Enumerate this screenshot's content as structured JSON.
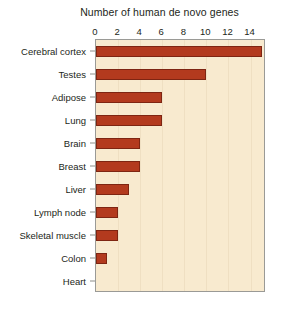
{
  "chart_data": {
    "type": "bar",
    "orientation": "horizontal",
    "title": "Number of human de novo genes",
    "xlabel": "",
    "ylabel": "",
    "categories": [
      "Cerebral cortex",
      "Testes",
      "Adipose",
      "Lung",
      "Brain",
      "Breast",
      "Liver",
      "Lymph node",
      "Skeletal muscle",
      "Colon",
      "Heart"
    ],
    "values": [
      15,
      10,
      6,
      6,
      4,
      4,
      3,
      2,
      2,
      1,
      0
    ],
    "xlim": [
      0,
      15.4
    ],
    "xticks": [
      0,
      2,
      4,
      6,
      8,
      10,
      12,
      14
    ],
    "xtick_labels": [
      "0",
      "2",
      "4",
      "6",
      "8",
      "10",
      "12",
      "14"
    ],
    "grid": true,
    "grid_axis": "x",
    "legend": null,
    "colors": {
      "bar_fill": "#b33a1e",
      "bar_edge": "#7e2512",
      "plot_background": "#f8eacf",
      "gridline": "#efdfc2",
      "plot_border": "#9a9a96",
      "text": "#231f20",
      "figure_background": "#ffffff"
    }
  }
}
